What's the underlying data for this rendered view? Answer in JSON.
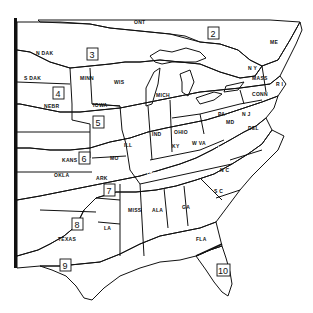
{
  "map": {
    "type": "hardiness-zone map (eastern United States)",
    "zones": [
      {
        "id": "2",
        "label": "2",
        "pattern": "diagonal-wide"
      },
      {
        "id": "3",
        "label": "3",
        "pattern": "blank"
      },
      {
        "id": "4",
        "label": "4",
        "pattern": "diagonal-dense"
      },
      {
        "id": "5",
        "label": "5",
        "pattern": "dots"
      },
      {
        "id": "6",
        "label": "6",
        "pattern": "horizontal-lines"
      },
      {
        "id": "7",
        "label": "7",
        "pattern": "crosshatch-dark"
      },
      {
        "id": "8",
        "label": "8",
        "pattern": "light-gray-stipple"
      },
      {
        "id": "9",
        "label": "9",
        "pattern": "sparse-dots"
      },
      {
        "id": "10",
        "label": "10",
        "pattern": "vertical-lines"
      }
    ],
    "state_labels": {
      "ont": "ONT",
      "ndak": "N DAK",
      "sdak": "S DAK",
      "minn": "MINN",
      "wis": "WIS",
      "mich": "MICH",
      "nebr": "NEBR",
      "iowa": "IOWA",
      "kans": "KANS",
      "mo": "MO",
      "ill": "ILL",
      "ind": "IND",
      "ohio": "OHIO",
      "pa": "PA",
      "ny": "N Y",
      "me": "ME",
      "nh": "N H",
      "vt": "VT",
      "mass": "MASS",
      "conn": "CONN",
      "ri": "R I",
      "nj": "N J",
      "del": "DEL",
      "md": "MD",
      "wva": "W VA",
      "va": "VA",
      "ky": "KY",
      "tenn": "TENN",
      "nc": "N C",
      "sc": "S C",
      "ga": "GA",
      "ala": "ALA",
      "miss": "MISS",
      "la": "LA",
      "ark": "ARK",
      "okla": "OKLA",
      "texas": "TEXAS",
      "fla": "FLA"
    }
  }
}
